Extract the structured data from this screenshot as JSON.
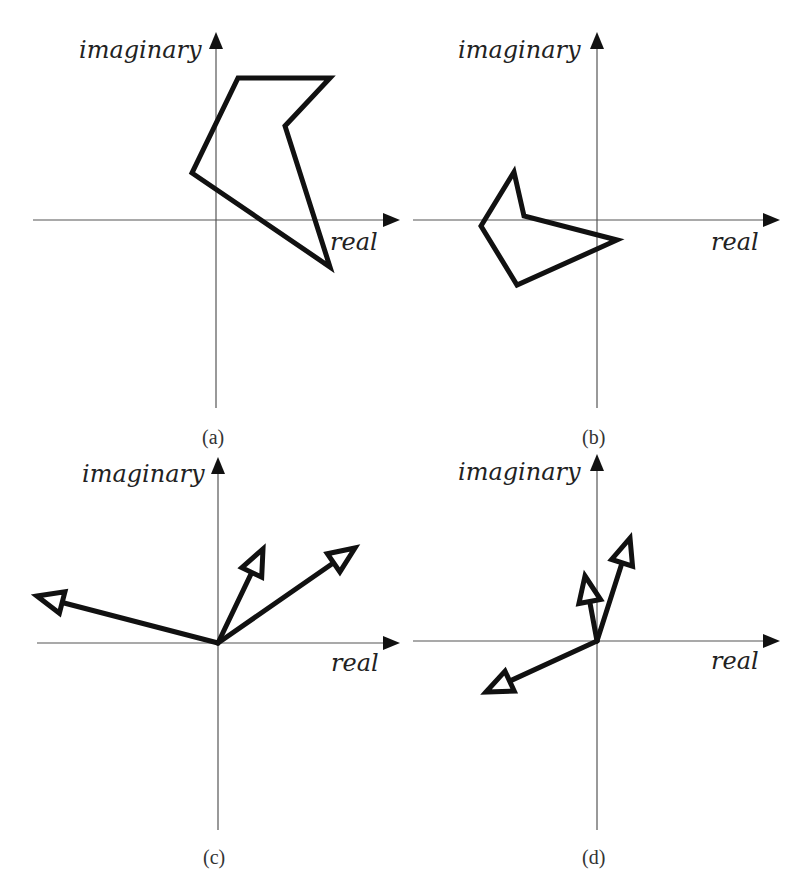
{
  "figure": {
    "panels": [
      {
        "id": "a",
        "label": "(a)",
        "axis_labels": {
          "x": "real",
          "y": "imaginary"
        },
        "origin": [
          216,
          220
        ],
        "content_type": "polygon",
        "polygon": [
          [
            238,
            78
          ],
          [
            330,
            78
          ],
          [
            285,
            126
          ],
          [
            330,
            267
          ],
          [
            192,
            173
          ]
        ]
      },
      {
        "id": "b",
        "label": "(b)",
        "axis_labels": {
          "x": "real",
          "y": "imaginary"
        },
        "origin": [
          597,
          220
        ],
        "content_type": "polygon",
        "polygon": [
          [
            514,
            172
          ],
          [
            524,
            216
          ],
          [
            617,
            240
          ],
          [
            517,
            285
          ],
          [
            481,
            226
          ]
        ]
      },
      {
        "id": "c",
        "label": "(c)",
        "axis_labels": {
          "x": "real",
          "y": "imaginary"
        },
        "origin": [
          218,
          643
        ],
        "content_type": "vectors",
        "vectors": [
          [
            37,
            596
          ],
          [
            263,
            549
          ],
          [
            355,
            548
          ]
        ]
      },
      {
        "id": "d",
        "label": "(d)",
        "axis_labels": {
          "x": "real",
          "y": "imaginary"
        },
        "origin": [
          597,
          641
        ],
        "content_type": "vectors",
        "vectors": [
          [
            630,
            538
          ],
          [
            585,
            576
          ],
          [
            486,
            692
          ]
        ]
      }
    ]
  }
}
